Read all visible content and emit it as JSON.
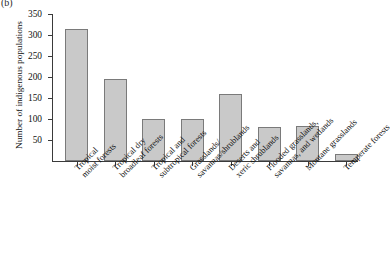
{
  "figure": {
    "panel_label": "(b)",
    "caption": ""
  },
  "chart_data": {
    "type": "bar",
    "title": "",
    "xlabel": "",
    "ylabel": "Number of indigenous populations",
    "ylim": [
      0,
      350
    ],
    "yticks": [
      50,
      100,
      150,
      200,
      250,
      300,
      350
    ],
    "ytick_labels": [
      "50",
      "100",
      "150",
      "200",
      "250",
      "300",
      "350"
    ],
    "grid": false,
    "legend": null,
    "bar_color": "#c9c9c9",
    "bar_edge_color": "#7a7a7a",
    "categories": [
      "Tropical moist forests",
      "Tropical dry broadleaf forests",
      "Tropical and subtropical forests",
      "Grasslands/ savannas/shrublands",
      "Deserts and xeric shrublands",
      "Flooded grasslands, savannas, and wetlands",
      "Montane grasslands",
      "Temperate forests"
    ],
    "category_lines": [
      [
        "Tropical",
        "moist forests"
      ],
      [
        "Tropical dry",
        "broadleaf forests"
      ],
      [
        "Tropical and",
        "subtropical forests"
      ],
      [
        "Grasslands/",
        "savannas/shrublands"
      ],
      [
        "Deserts and",
        "xeric shrublands"
      ],
      [
        "Flooded grasslands,",
        "savannas, and wetlands"
      ],
      [
        "Montane grasslands",
        ""
      ],
      [
        "Temperate forests",
        ""
      ]
    ],
    "values": [
      315,
      196,
      99,
      100,
      160,
      82,
      83,
      16
    ]
  }
}
